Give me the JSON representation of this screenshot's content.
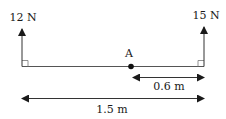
{
  "diagram": {
    "forces": [
      {
        "label": "12 N",
        "position": "left",
        "direction": "up"
      },
      {
        "label": "15 N",
        "position": "right",
        "direction": "up"
      }
    ],
    "point": {
      "label": "A"
    },
    "dimensions": [
      {
        "label": "0.6 m",
        "from": "A",
        "to": "right end"
      },
      {
        "label": "1.5 m",
        "from": "left end",
        "to": "right end"
      }
    ],
    "colors": {
      "stroke": "#1a1a1a",
      "background": "#ffffff"
    }
  }
}
